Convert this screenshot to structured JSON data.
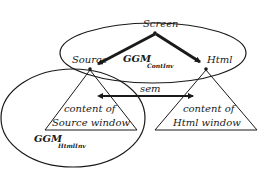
{
  "diagram": {
    "nodes": {
      "screen": {
        "label": "Screen"
      },
      "source": {
        "label": "Source"
      },
      "html": {
        "label": "Html"
      }
    },
    "triangles": {
      "source_content": {
        "line1": "content of",
        "line2": "Source window"
      },
      "html_content": {
        "line1": "content of",
        "line2": "Html window"
      }
    },
    "ellipses": {
      "contInv": {
        "label_main": "GGM",
        "label_sub": "ContInv"
      },
      "htmlInv": {
        "label_main": "GGM",
        "label_sub": "HtmlInv"
      }
    },
    "edges": [
      {
        "from": "Screen",
        "to": "Source",
        "style": "bold-arrow"
      },
      {
        "from": "Screen",
        "to": "Html",
        "style": "bold-arrow"
      },
      {
        "from": "Source window",
        "to": "Html window",
        "label": "sem",
        "style": "double-arrow"
      }
    ]
  }
}
